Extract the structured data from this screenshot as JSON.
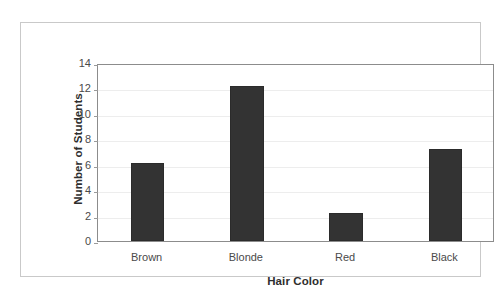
{
  "chart_data": {
    "type": "bar",
    "title": "",
    "subtitle": "",
    "categories": [
      "Brown",
      "Blonde",
      "Red",
      "Black"
    ],
    "values": [
      6.1,
      12.2,
      2.2,
      7.2
    ],
    "xlabel": "Hair Color",
    "ylabel": "Number of Students",
    "ylim": [
      0,
      14
    ],
    "yticks": [
      0,
      2,
      4,
      6,
      8,
      10,
      12,
      14
    ],
    "ytick_labels": [
      "0",
      "2",
      "4",
      "6",
      "8",
      "10",
      "12",
      "14"
    ],
    "grid": true,
    "grid_axis": "y",
    "legend": false,
    "legend_position": "none",
    "bar_color": "#333333",
    "axis_color": "#8c8c8c",
    "gridline_color": "#ededed",
    "frame_color": "#c9c9c9",
    "background_color": "#ffffff",
    "text_color": "#3a3a3a",
    "bar_width_fraction": 0.34,
    "series": [
      {
        "name": "Number of Students",
        "values": [
          6.1,
          12.2,
          2.2,
          7.2
        ]
      }
    ],
    "points": [
      {
        "category": "Brown",
        "value": 6.1
      },
      {
        "category": "Blonde",
        "value": 12.2
      },
      {
        "category": "Red",
        "value": 2.2
      },
      {
        "category": "Black",
        "value": 7.2
      }
    ]
  }
}
